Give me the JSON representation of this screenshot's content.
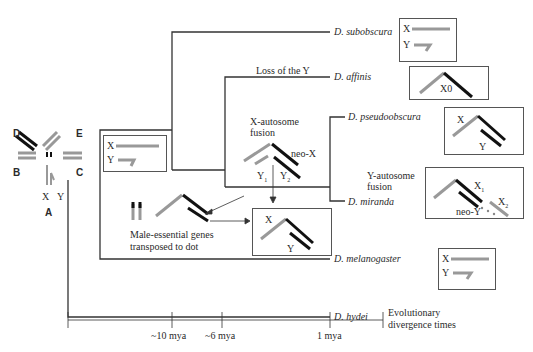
{
  "muller_elements": {
    "D": "D",
    "E": "E",
    "B": "B",
    "C": "C",
    "A": "A",
    "X": "X",
    "Y": "Y"
  },
  "species": [
    {
      "name": "D. subobscura",
      "karyotype": "X / Y"
    },
    {
      "name": "D. affinis",
      "karyotype": "X0"
    },
    {
      "name": "D. pseudoobscura",
      "karyotype": "X / Y"
    },
    {
      "name": "D. miranda",
      "karyotype": "X1 / X2 / neo-Y"
    },
    {
      "name": "D. melanogaster",
      "karyotype": "X / Y"
    },
    {
      "name": "D. hydei",
      "karyotype": ""
    }
  ],
  "events": {
    "loss_y": "Loss of the Y",
    "x_autosome_1": "X-autosome",
    "x_autosome_2": "fusion",
    "neo_x": "neo-X",
    "y1": "Y",
    "y1_sub": "1",
    "y2": "Y",
    "y2_sub": "2",
    "y_autosome_1": "Y-autosome",
    "y_autosome_2": "fusion",
    "male_genes_1": "Male-essential genes",
    "male_genes_2": "transposed to dot"
  },
  "karyotype_labels": {
    "x": "X",
    "y": "Y",
    "x0": "X0",
    "x1": "X",
    "x1_sub": "1",
    "x2": "X",
    "x2_sub": "2",
    "neo_y": "neo-Y"
  },
  "timeline": {
    "ticks": [
      "~10 mya",
      "~6 mya",
      "1 mya"
    ],
    "label_1": "Evolutionary",
    "label_2": "divergence times"
  },
  "colors": {
    "gray_chromosome": "#a0a0a0",
    "black_chromosome": "#111111",
    "tree_line": "#333333"
  }
}
